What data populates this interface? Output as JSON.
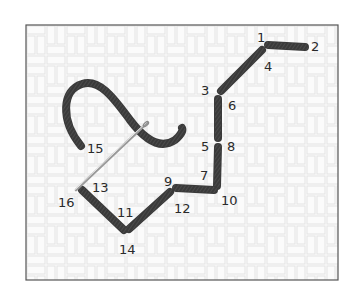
{
  "diagram": {
    "type": "embroidery-stitch-sequence",
    "frame": {
      "x": 26,
      "y": 25,
      "width": 312,
      "height": 255,
      "border_color": "#555555",
      "fabric_color": "#fbfbfb",
      "weave_color": "#e6e6e6"
    },
    "thread_color": "#3a3a3a",
    "needle_color": "#bdbdbd",
    "labels": [
      {
        "id": "1",
        "x": 257,
        "y": 42
      },
      {
        "id": "2",
        "x": 311,
        "y": 51
      },
      {
        "id": "3",
        "x": 201,
        "y": 95
      },
      {
        "id": "4",
        "x": 264,
        "y": 71
      },
      {
        "id": "5",
        "x": 201,
        "y": 151
      },
      {
        "id": "6",
        "x": 228,
        "y": 110
      },
      {
        "id": "7",
        "x": 200,
        "y": 180
      },
      {
        "id": "8",
        "x": 227,
        "y": 151
      },
      {
        "id": "9",
        "x": 164,
        "y": 186
      },
      {
        "id": "10",
        "x": 221,
        "y": 205
      },
      {
        "id": "11",
        "x": 117,
        "y": 217
      },
      {
        "id": "12",
        "x": 174,
        "y": 213
      },
      {
        "id": "13",
        "x": 92,
        "y": 192
      },
      {
        "id": "14",
        "x": 119,
        "y": 254
      },
      {
        "id": "15",
        "x": 87,
        "y": 153
      },
      {
        "id": "16",
        "x": 58,
        "y": 207
      }
    ],
    "stitches": [
      {
        "name": "stitch-1-2",
        "x1": 268,
        "y1": 45,
        "x2": 305,
        "y2": 47
      },
      {
        "name": "stitch-4-3",
        "x1": 262,
        "y1": 50,
        "x2": 221,
        "y2": 91
      },
      {
        "name": "stitch-6-5",
        "x1": 218,
        "y1": 99,
        "x2": 218,
        "y2": 138
      },
      {
        "name": "stitch-8-7",
        "x1": 218,
        "y1": 147,
        "x2": 217,
        "y2": 186
      },
      {
        "name": "stitch-10-9",
        "x1": 214,
        "y1": 190,
        "x2": 176,
        "y2": 188
      },
      {
        "name": "stitch-12-11",
        "x1": 170,
        "y1": 192,
        "x2": 129,
        "y2": 229
      },
      {
        "name": "stitch-14-13",
        "x1": 124,
        "y1": 230,
        "x2": 82,
        "y2": 190
      }
    ],
    "loose_thread_path": "M 81 146 C 60 120, 62 90, 82 84 C 100 78, 115 100, 130 120 C 145 140, 160 150, 175 140 C 182 134, 183 130, 182 128",
    "needle": {
      "x1": 147,
      "y1": 123,
      "x2": 76,
      "y2": 190
    }
  }
}
